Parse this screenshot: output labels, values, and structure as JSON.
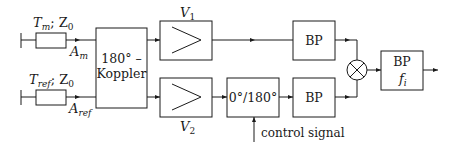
{
  "diagram": {
    "inputs": {
      "measurement": {
        "line_label": "T",
        "line_label_sub": "m",
        "impedance": "; Z",
        "impedance_sub": "0",
        "port_label": "A",
        "port_label_sub": "m"
      },
      "reference": {
        "line_label": "T",
        "line_label_sub": "ref",
        "impedance": "; Z",
        "impedance_sub": "0",
        "port_label": "A",
        "port_label_sub": "ref"
      }
    },
    "coupler": {
      "line1": "180° –",
      "line2": "Koppler"
    },
    "amplifiers": {
      "top": {
        "label": "V",
        "sub": "1"
      },
      "bottom": {
        "label": "V",
        "sub": "2"
      }
    },
    "phase_shifter": {
      "label": "0°/180°"
    },
    "control": {
      "label": "control signal"
    },
    "bandpass_top": {
      "label": "BP"
    },
    "bandpass_bottom": {
      "label": "BP"
    },
    "mixer": {
      "symbol": "multiplier"
    },
    "output_filter": {
      "label": "BP",
      "sub_label": "f",
      "sub_label_sub": "i"
    }
  }
}
